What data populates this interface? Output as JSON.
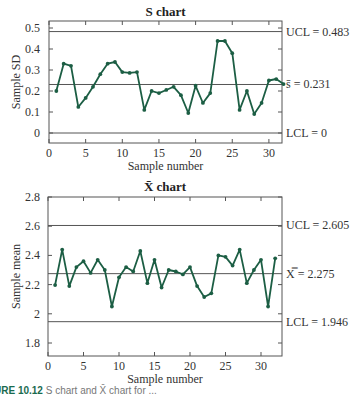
{
  "chart_data": [
    {
      "type": "line",
      "title": "S chart",
      "xlabel": "Sample number",
      "ylabel": "Sample SD",
      "xlim": [
        0,
        32
      ],
      "ylim": [
        -0.05,
        0.5
      ],
      "xticks": [
        0,
        5,
        10,
        15,
        20,
        25,
        30
      ],
      "yticks": [
        0,
        0.1,
        0.2,
        0.3,
        0.4,
        0.5
      ],
      "ytick_labels": [
        "0",
        "0.1",
        "0.2",
        "0.3",
        "0.4",
        "0.5"
      ],
      "grid": false,
      "control_lines": [
        {
          "name": "UCL",
          "value": 0.483,
          "label": "UCL = 0.483"
        },
        {
          "name": "center",
          "value": 0.231,
          "label": "s̄ = 0.231"
        },
        {
          "name": "LCL",
          "value": 0,
          "label": "LCL = 0"
        }
      ],
      "x": [
        1,
        2,
        3,
        4,
        5,
        6,
        7,
        8,
        9,
        10,
        11,
        12,
        13,
        14,
        15,
        16,
        17,
        18,
        19,
        20,
        21,
        22,
        23,
        24,
        25,
        26,
        27,
        28,
        29,
        30,
        31,
        32
      ],
      "values": [
        0.2,
        0.33,
        0.32,
        0.124,
        0.167,
        0.22,
        0.28,
        0.33,
        0.338,
        0.29,
        0.286,
        0.29,
        0.11,
        0.2,
        0.19,
        0.205,
        0.22,
        0.18,
        0.095,
        0.225,
        0.143,
        0.19,
        0.438,
        0.438,
        0.38,
        0.11,
        0.2,
        0.09,
        0.143,
        0.25,
        0.257,
        0.233
      ],
      "line_color": "#1c5e44"
    },
    {
      "type": "line",
      "title": "X̄ chart",
      "xlabel": "Sample number",
      "ylabel": "Sample mean",
      "xlim": [
        0,
        33
      ],
      "ylim": [
        1.7,
        2.8
      ],
      "xticks": [
        0,
        5,
        10,
        15,
        20,
        25,
        30
      ],
      "yticks": [
        1.8,
        2.0,
        2.2,
        2.4,
        2.6,
        2.8
      ],
      "ytick_labels": [
        "1.8",
        "2",
        "2.2",
        "2.4",
        "2.6",
        "2.8"
      ],
      "grid": false,
      "control_lines": [
        {
          "name": "UCL",
          "value": 2.605,
          "label": "UCL = 2.605"
        },
        {
          "name": "center",
          "value": 2.275,
          "label": "X̿ = 2.275"
        },
        {
          "name": "LCL",
          "value": 1.946,
          "label": "LCL = 1.946"
        }
      ],
      "x": [
        1,
        2,
        3,
        4,
        5,
        6,
        7,
        8,
        9,
        10,
        11,
        12,
        13,
        14,
        15,
        16,
        17,
        18,
        19,
        20,
        21,
        22,
        23,
        24,
        25,
        26,
        27,
        28,
        29,
        30,
        31,
        32
      ],
      "values": [
        2.197,
        2.44,
        2.19,
        2.32,
        2.36,
        2.28,
        2.37,
        2.3,
        2.05,
        2.25,
        2.32,
        2.29,
        2.43,
        2.21,
        2.37,
        2.18,
        2.3,
        2.29,
        2.27,
        2.32,
        2.19,
        2.115,
        2.14,
        2.4,
        2.39,
        2.33,
        2.44,
        2.21,
        2.3,
        2.37,
        2.05,
        2.38
      ],
      "line_color": "#1c5e44"
    }
  ],
  "caption": {
    "label": "URE 10.12",
    "text": "S chart and X̄ chart for ..."
  }
}
